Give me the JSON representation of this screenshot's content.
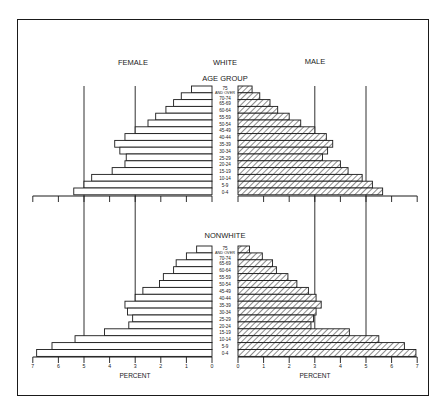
{
  "labels": {
    "female": "FEMALE",
    "male": "MALE",
    "top_title": "WHITE",
    "age_group": "AGE GROUP",
    "bottom_title": "NONWHITE",
    "percent_left": "PERCENT",
    "percent_right": "PERCENT"
  },
  "colors": {
    "ink": "#1a1a1a",
    "paper": "#ffffff",
    "bar_fill_female": "#ffffff",
    "hatch": "#2a2a2a"
  },
  "chart_data": [
    {
      "type": "bar",
      "orientation": "horizontal-pyramid",
      "title": "WHITE",
      "ylabel": "AGE GROUP",
      "xlabel": "PERCENT",
      "xlim": [
        0,
        7
      ],
      "x_ticks": [
        0,
        1,
        2,
        3,
        4,
        5,
        6,
        7
      ],
      "gridlines_at": [
        3,
        5
      ],
      "categories": [
        "75 AND OVER",
        "70-74",
        "65-69",
        "60-64",
        "55-59",
        "50-54",
        "45-49",
        "40-44",
        "35-39",
        "30-34",
        "25-29",
        "20-24",
        "15-19",
        "10-14",
        "5-9",
        "0-4"
      ],
      "series": [
        {
          "name": "FEMALE",
          "side": "left",
          "pattern": "open",
          "values": [
            0.8,
            1.2,
            1.5,
            1.8,
            2.2,
            2.5,
            3.0,
            3.4,
            3.8,
            3.6,
            3.35,
            3.4,
            3.9,
            4.7,
            5.0,
            5.4
          ]
        },
        {
          "name": "MALE",
          "side": "right",
          "pattern": "hatched",
          "values": [
            0.55,
            0.85,
            1.25,
            1.55,
            2.0,
            2.45,
            3.0,
            3.45,
            3.7,
            3.5,
            3.3,
            4.0,
            4.3,
            4.85,
            5.25,
            5.65
          ]
        }
      ]
    },
    {
      "type": "bar",
      "orientation": "horizontal-pyramid",
      "title": "NONWHITE",
      "ylabel": "AGE GROUP",
      "xlabel": "PERCENT",
      "xlim": [
        0,
        7
      ],
      "x_ticks": [
        0,
        1,
        2,
        3,
        4,
        5,
        6,
        7
      ],
      "gridlines_at": [
        3,
        5
      ],
      "categories": [
        "75 AND OVER",
        "70-74",
        "65-69",
        "60-64",
        "55-59",
        "50-54",
        "45-49",
        "40-44",
        "35-39",
        "30-34",
        "25-29",
        "20-24",
        "15-19",
        "10-14",
        "5-9",
        "0-4"
      ],
      "series": [
        {
          "name": "FEMALE",
          "side": "left",
          "pattern": "open",
          "values": [
            0.6,
            1.0,
            1.4,
            1.5,
            1.9,
            2.05,
            2.7,
            3.0,
            3.4,
            3.3,
            3.1,
            3.25,
            4.2,
            5.35,
            6.25,
            6.85
          ]
        },
        {
          "name": "MALE",
          "side": "right",
          "pattern": "hatched",
          "values": [
            0.45,
            0.95,
            1.35,
            1.5,
            1.95,
            2.3,
            2.75,
            3.05,
            3.25,
            3.05,
            2.95,
            2.85,
            4.35,
            5.5,
            6.5,
            6.95
          ]
        }
      ]
    }
  ]
}
